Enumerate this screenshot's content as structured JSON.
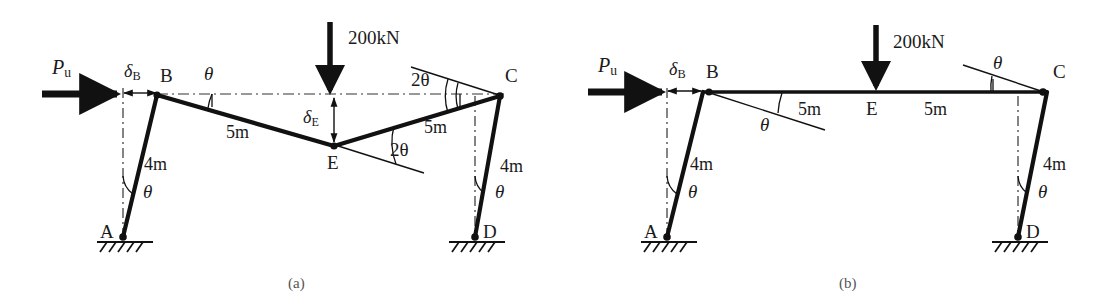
{
  "figure": {
    "panels": [
      {
        "id": "a",
        "caption": "(a)",
        "mechanism": "combined-sway-and-beam",
        "nodes": [
          {
            "name": "A",
            "label": "A",
            "x": 123,
            "y": 237,
            "type": "pinned-support"
          },
          {
            "name": "B",
            "label": "B",
            "x": 157,
            "y": 95,
            "type": "hinge"
          },
          {
            "name": "E",
            "label": "E",
            "x": 334,
            "y": 146,
            "type": "hinge"
          },
          {
            "name": "C",
            "label": "C",
            "x": 500,
            "y": 96,
            "type": "hinge"
          },
          {
            "name": "D",
            "label": "D",
            "x": 475,
            "y": 237,
            "type": "pinned-support"
          }
        ],
        "members": [
          {
            "name": "column-AB",
            "from": "A",
            "to": "B",
            "length_label": "4m"
          },
          {
            "name": "beam-BE",
            "from": "B",
            "to": "E",
            "length_label": "5m"
          },
          {
            "name": "beam-EC",
            "from": "E",
            "to": "C",
            "length_label": "5m"
          },
          {
            "name": "column-DC",
            "from": "D",
            "to": "C",
            "length_label": "4m"
          }
        ],
        "loads": [
          {
            "name": "horizontal-load",
            "label": "P",
            "sublabel": "u",
            "direction": "right"
          },
          {
            "name": "vertical-point-load",
            "label": "200kN",
            "direction": "down",
            "applied_at": "E"
          }
        ],
        "displacements": [
          {
            "name": "sway-displacement",
            "label": "δ",
            "sublabel": "B",
            "direction": "horizontal"
          },
          {
            "name": "beam-deflection",
            "label": "δ",
            "sublabel": "E",
            "direction": "vertical"
          }
        ],
        "angles": [
          {
            "name": "angle-at-B",
            "label": "θ",
            "at": "B"
          },
          {
            "name": "angle-at-A",
            "label": "θ",
            "at": "A"
          },
          {
            "name": "angle-at-E",
            "label": "2θ",
            "at": "E"
          },
          {
            "name": "angle-at-C",
            "label": "2θ",
            "at": "C"
          },
          {
            "name": "angle-at-D",
            "label": "θ",
            "at": "D"
          }
        ]
      },
      {
        "id": "b",
        "caption": "(b)",
        "mechanism": "pure-sway",
        "nodes": [
          {
            "name": "A",
            "label": "A",
            "x": 667,
            "y": 237,
            "type": "pinned-support"
          },
          {
            "name": "B",
            "label": "B",
            "x": 703,
            "y": 92,
            "type": "hinge"
          },
          {
            "name": "E",
            "label": "E",
            "x": 876,
            "y": 92,
            "type": "midpoint"
          },
          {
            "name": "C",
            "label": "C",
            "x": 1047,
            "y": 92,
            "type": "hinge"
          },
          {
            "name": "D",
            "label": "D",
            "x": 1018,
            "y": 237,
            "type": "pinned-support"
          }
        ],
        "members": [
          {
            "name": "column-AB",
            "from": "A",
            "to": "B",
            "length_label": "4m"
          },
          {
            "name": "beam-BE",
            "from": "B",
            "to": "E",
            "length_label": "5m"
          },
          {
            "name": "beam-EC",
            "from": "E",
            "to": "C",
            "length_label": "5m"
          },
          {
            "name": "column-DC",
            "from": "D",
            "to": "C",
            "length_label": "4m"
          }
        ],
        "loads": [
          {
            "name": "horizontal-load",
            "label": "P",
            "sublabel": "u",
            "direction": "right"
          },
          {
            "name": "vertical-point-load",
            "label": "200kN",
            "direction": "down",
            "applied_at": "E"
          }
        ],
        "displacements": [
          {
            "name": "sway-displacement",
            "label": "δ",
            "sublabel": "B",
            "direction": "horizontal"
          }
        ],
        "angles": [
          {
            "name": "angle-at-B",
            "label": "θ",
            "at": "B"
          },
          {
            "name": "angle-at-A",
            "label": "θ",
            "at": "A"
          },
          {
            "name": "angle-at-C",
            "label": "θ",
            "at": "C"
          },
          {
            "name": "angle-at-D",
            "label": "θ",
            "at": "D"
          }
        ]
      }
    ],
    "text": {
      "point_a": "A",
      "point_b": "B",
      "point_c": "C",
      "point_d": "D",
      "point_e": "E",
      "len_4m": "4m",
      "len_5m": "5m",
      "load_200kn": "200kN",
      "force_p": "P",
      "force_p_sub": "u",
      "delta": "δ",
      "delta_b_sub": "B",
      "delta_e_sub": "E",
      "theta": "θ",
      "two_theta": "2θ",
      "caption_a": "(a)",
      "caption_b": "(b)"
    },
    "colors": {
      "member": "#111111",
      "construction": "#333333",
      "text": "#1a1a1a",
      "caption": "#555555",
      "background": "#ffffff"
    }
  }
}
